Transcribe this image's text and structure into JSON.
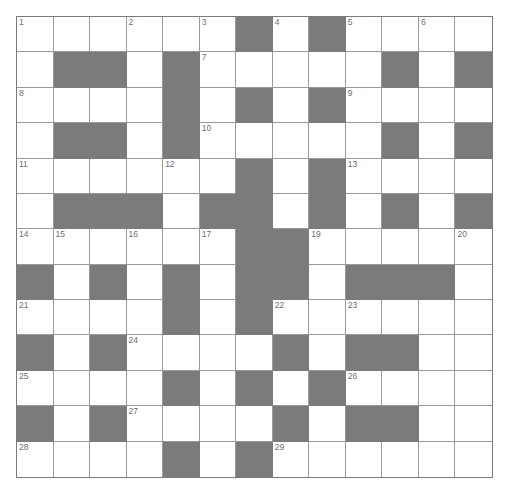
{
  "puzzle": {
    "rows": 13,
    "cols": 13,
    "colors": {
      "black": "#7b7b7b",
      "white": "#ffffff",
      "line": "#9a9a9a",
      "number": "#6e6e6e"
    },
    "pattern": [
      "......#.#....",
      ".##.#.....#.#",
      "....#.#.#....",
      ".##.#.....#.#",
      "......#.#....",
      ".###.##.#.#.#",
      "......##.....",
      "#.#.#.##.###.",
      "....#.#......",
      "#.#....#.##.",
      "....#.#.#....",
      "#.#....#.##.",
      "....#.#......"
    ],
    "numbers": [
      {
        "r": 0,
        "c": 0,
        "n": "1"
      },
      {
        "r": 0,
        "c": 3,
        "n": "2"
      },
      {
        "r": 0,
        "c": 5,
        "n": "3"
      },
      {
        "r": 0,
        "c": 7,
        "n": "4"
      },
      {
        "r": 0,
        "c": 9,
        "n": "5"
      },
      {
        "r": 0,
        "c": 11,
        "n": "6"
      },
      {
        "r": 1,
        "c": 5,
        "n": "7"
      },
      {
        "r": 2,
        "c": 0,
        "n": "8"
      },
      {
        "r": 2,
        "c": 9,
        "n": "9"
      },
      {
        "r": 3,
        "c": 5,
        "n": "10"
      },
      {
        "r": 4,
        "c": 0,
        "n": "11"
      },
      {
        "r": 4,
        "c": 4,
        "n": "12"
      },
      {
        "r": 4,
        "c": 9,
        "n": "13"
      },
      {
        "r": 6,
        "c": 0,
        "n": "14"
      },
      {
        "r": 6,
        "c": 1,
        "n": "15"
      },
      {
        "r": 6,
        "c": 3,
        "n": "16"
      },
      {
        "r": 6,
        "c": 5,
        "n": "17"
      },
      {
        "r": 6,
        "c": 7,
        "n": "18"
      },
      {
        "r": 6,
        "c": 8,
        "n": "19"
      },
      {
        "r": 6,
        "c": 12,
        "n": "20"
      },
      {
        "r": 8,
        "c": 0,
        "n": "21"
      },
      {
        "r": 8,
        "c": 7,
        "n": "22"
      },
      {
        "r": 8,
        "c": 9,
        "n": "23"
      },
      {
        "r": 9,
        "c": 3,
        "n": "24"
      },
      {
        "r": 10,
        "c": 0,
        "n": "25"
      },
      {
        "r": 10,
        "c": 9,
        "n": "26"
      },
      {
        "r": 11,
        "c": 3,
        "n": "27"
      },
      {
        "r": 12,
        "c": 0,
        "n": "28"
      },
      {
        "r": 12,
        "c": 7,
        "n": "29"
      }
    ]
  }
}
